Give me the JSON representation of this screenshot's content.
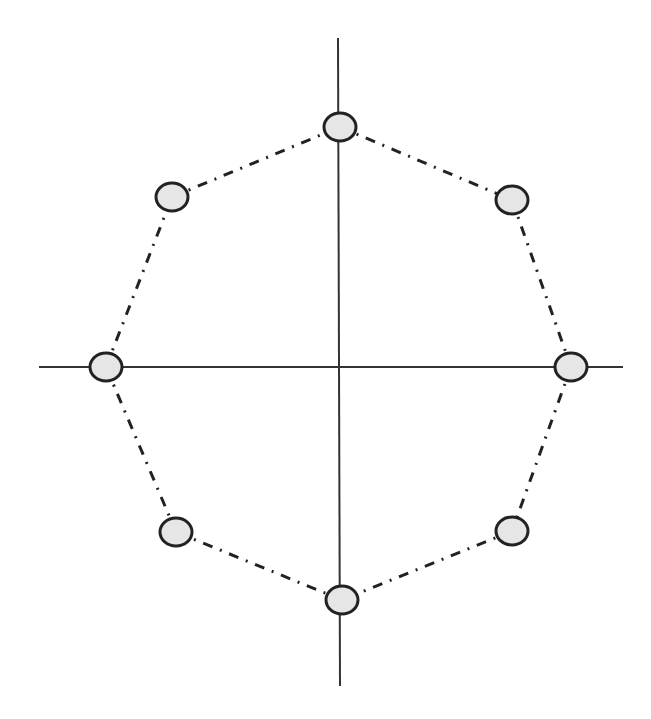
{
  "diagram": {
    "type": "octagon-constellation",
    "colors": {
      "axis": "#333333",
      "node_fill": "#e6e6e6",
      "node_stroke": "#222222",
      "edge": "#222222",
      "background": "#ffffff"
    },
    "nodes": [
      {
        "id": "n-top",
        "angle_deg": 90
      },
      {
        "id": "n-top-right",
        "angle_deg": 45
      },
      {
        "id": "n-right",
        "angle_deg": 0
      },
      {
        "id": "n-bottom-right",
        "angle_deg": -45
      },
      {
        "id": "n-bottom",
        "angle_deg": -90
      },
      {
        "id": "n-bottom-left",
        "angle_deg": -135
      },
      {
        "id": "n-left",
        "angle_deg": 180
      },
      {
        "id": "n-top-left",
        "angle_deg": 135
      }
    ],
    "edges": [
      [
        "n-top",
        "n-top-right"
      ],
      [
        "n-top-right",
        "n-right"
      ],
      [
        "n-right",
        "n-bottom-right"
      ],
      [
        "n-bottom-right",
        "n-bottom"
      ],
      [
        "n-bottom",
        "n-bottom-left"
      ],
      [
        "n-bottom-left",
        "n-left"
      ],
      [
        "n-left",
        "n-top-left"
      ],
      [
        "n-top-left",
        "n-top"
      ]
    ],
    "edge_style": "dash-dot",
    "axes": [
      "horizontal",
      "vertical"
    ]
  }
}
